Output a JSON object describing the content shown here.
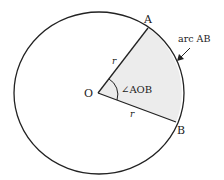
{
  "diagram": {
    "labels": {
      "center": "O",
      "point_a": "A",
      "point_b": "B",
      "radius_upper": "r",
      "radius_lower": "r",
      "angle": "∠AOB",
      "arc": "arc AB"
    },
    "colors": {
      "stroke": "#222222",
      "sector_fill": "#ececec",
      "background": "#ffffff"
    }
  }
}
